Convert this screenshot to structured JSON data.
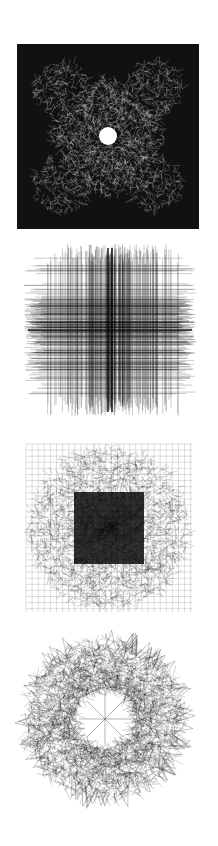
{
  "figure": {
    "background": "#ffffff",
    "ink": "#000000",
    "panels": [
      {
        "id": "panel-1",
        "description": "dense graph layout, dark square with bright center cross",
        "style": "dense-square",
        "box": [
          17,
          44,
          182,
          185
        ]
      },
      {
        "id": "panel-2",
        "description": "grid-like graph layout with horizontal and vertical line bundles",
        "style": "grid",
        "box": [
          20,
          240,
          180,
          180
        ]
      },
      {
        "id": "panel-3",
        "description": "pillow-shaped mesh graph layout, dark center",
        "style": "mesh",
        "box": [
          22,
          440,
          174,
          176
        ]
      },
      {
        "id": "panel-4",
        "description": "ring-shaped graph layout with star-like spikes and hollow center",
        "style": "ring",
        "box": [
          15,
          628,
          180,
          182
        ]
      }
    ]
  }
}
